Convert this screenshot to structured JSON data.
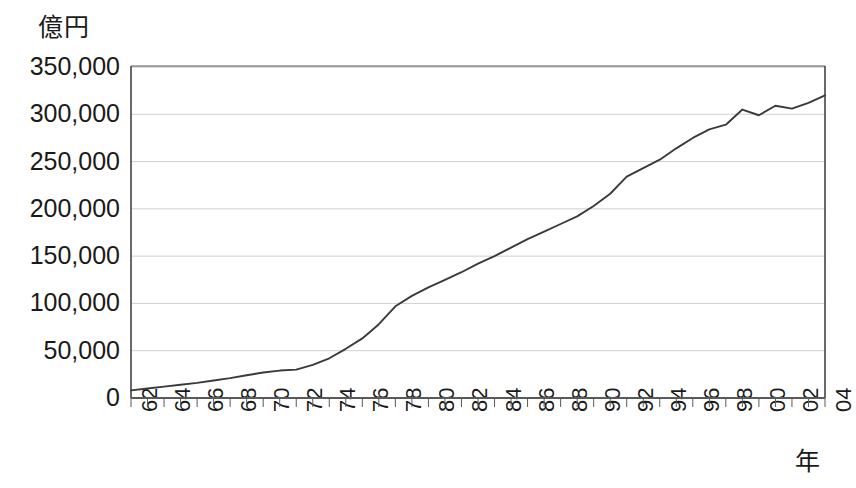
{
  "chart_data": {
    "type": "line",
    "title": "",
    "unit_label": "億円",
    "xlabel": "年",
    "ylabel": "",
    "ylim": [
      0,
      350000
    ],
    "ytick_values": [
      0,
      50000,
      100000,
      150000,
      200000,
      250000,
      300000,
      350000
    ],
    "ytick_labels": [
      "0",
      "50,000",
      "100,000",
      "150,000",
      "200,000",
      "250,000",
      "300,000",
      "350,000"
    ],
    "xtick_labels": [
      "62",
      "64",
      "66",
      "68",
      "70",
      "72",
      "74",
      "76",
      "78",
      "80",
      "82",
      "84",
      "86",
      "88",
      "90",
      "92",
      "94",
      "96",
      "98",
      "00",
      "02",
      "04"
    ],
    "x": [
      "62",
      "63",
      "64",
      "65",
      "66",
      "67",
      "68",
      "69",
      "70",
      "71",
      "72",
      "73",
      "74",
      "75",
      "76",
      "77",
      "78",
      "79",
      "80",
      "81",
      "82",
      "83",
      "84",
      "85",
      "86",
      "87",
      "88",
      "89",
      "90",
      "91",
      "92",
      "93",
      "94",
      "95",
      "96",
      "97",
      "98",
      "99",
      "00",
      "01",
      "02",
      "03",
      "04"
    ],
    "values": [
      8000,
      10000,
      12000,
      14000,
      16000,
      18500,
      21000,
      24000,
      27000,
      29000,
      30000,
      35000,
      42000,
      52000,
      63000,
      78000,
      97000,
      108000,
      117000,
      125000,
      133000,
      142000,
      150000,
      159000,
      168000,
      176000,
      184000,
      192000,
      203000,
      216000,
      234000,
      243000,
      252000,
      264000,
      275000,
      284000,
      289000,
      305000,
      299000,
      309000,
      306000,
      312000,
      320000
    ],
    "grid": true,
    "legend": "none",
    "line_color": "#3a3a3a",
    "grid_color": "#d0d0d0",
    "axis_color": "#595959"
  },
  "plot_geometry": {
    "left": 131,
    "right": 825,
    "top": 67,
    "bottom": 398
  }
}
